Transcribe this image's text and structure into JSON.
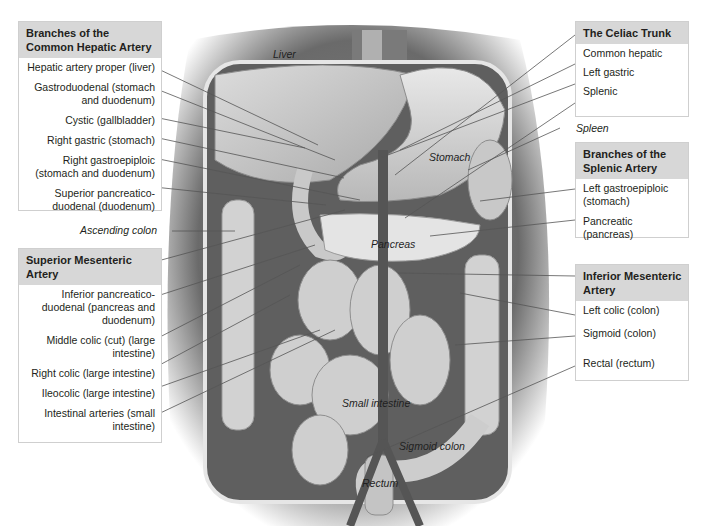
{
  "boxes": {
    "common_hepatic": {
      "title": "Branches of the Common Hepatic Artery",
      "items": [
        "Hepatic artery proper (liver)",
        "Gastroduodenal (stomach and duodenum)",
        "Cystic (gallbladder)",
        "Right gastric (stomach)",
        "Right gastroepiploic (stomach and duodenum)",
        "Superior pancreatico-duodenal (duodenum)"
      ]
    },
    "superior_mesenteric": {
      "title": "Superior Mesenteric Artery",
      "items": [
        "Inferior pancreatico-duodenal (pancreas and duodenum)",
        "Middle colic (cut) (large intestine)",
        "Right colic (large intestine)",
        "Ileocolic (large intestine)",
        "Intestinal arteries (small intestine)"
      ]
    },
    "celiac_trunk": {
      "title": "The Celiac Trunk",
      "items": [
        "Common hepatic",
        "Left gastric",
        "Splenic"
      ]
    },
    "splenic": {
      "title": "Branches of the Splenic Artery",
      "items": [
        "Left gastroepiploic (stomach)",
        "Pancreatic (pancreas)"
      ]
    },
    "inferior_mesenteric": {
      "title": "Inferior Mesenteric Artery",
      "items": [
        "Left colic (colon)",
        "Sigmoid (colon)",
        "Rectal (rectum)"
      ]
    }
  },
  "floating_labels": {
    "ascending_colon": "Ascending colon",
    "spleen": "Spleen"
  },
  "organ_labels": {
    "liver": "Liver",
    "stomach": "Stomach",
    "pancreas": "Pancreas",
    "small_intestine": "Small intestine",
    "sigmoid_colon": "Sigmoid colon",
    "rectum": "Rectum"
  },
  "colors": {
    "box_header": "#d7d7d7",
    "box_border": "#cfcfcf",
    "leader_line": "#555555",
    "tissue_dark": "#6e6e6e",
    "tissue_light": "#d9d9d9"
  }
}
